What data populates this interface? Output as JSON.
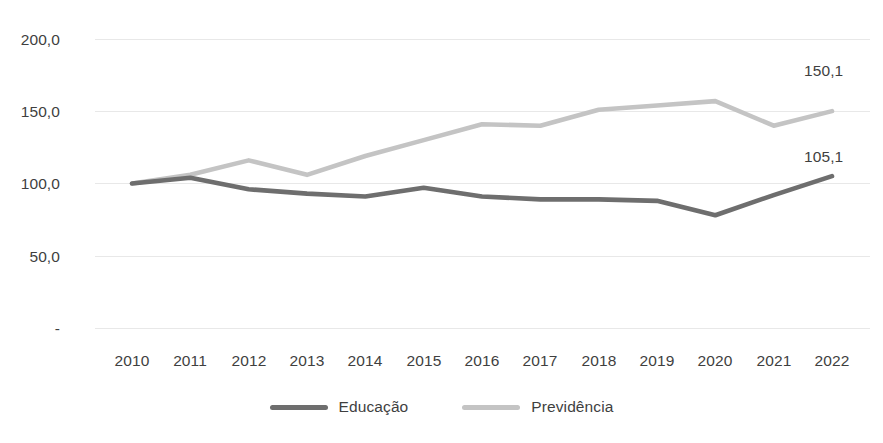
{
  "chart_data": {
    "type": "line",
    "title": "",
    "subtitle": "",
    "xlabel": "",
    "ylabel": "",
    "categories": [
      "2010",
      "2011",
      "2012",
      "2013",
      "2014",
      "2015",
      "2016",
      "2017",
      "2018",
      "2019",
      "2020",
      "2021",
      "2022"
    ],
    "ylim": [
      0,
      200
    ],
    "yticks": [
      0,
      50,
      100,
      150,
      200
    ],
    "ytick_labels": [
      "-",
      "50,0",
      "100,0",
      "150,0",
      "200,0"
    ],
    "grid": true,
    "legend_position": "bottom",
    "series": [
      {
        "name": "Educação",
        "color": "#6e6e6e",
        "values": [
          100.0,
          104.0,
          96.0,
          93.0,
          91.0,
          97.0,
          91.0,
          89.0,
          89.0,
          88.0,
          78.0,
          92.0,
          105.1
        ],
        "end_label": "105,1"
      },
      {
        "name": "Previdência",
        "color": "#c4c4c4",
        "values": [
          100.0,
          106.0,
          116.0,
          106.0,
          119.0,
          130.0,
          141.0,
          140.0,
          151.0,
          154.0,
          157.0,
          140.0,
          150.1
        ],
        "end_label": "150,1"
      }
    ],
    "annotations": [
      {
        "text": "150,1",
        "series": "Previdência",
        "category": "2022"
      },
      {
        "text": "105,1",
        "series": "Educação",
        "category": "2022"
      }
    ]
  },
  "legend": {
    "items": [
      {
        "label": "Educação",
        "color": "#6e6e6e"
      },
      {
        "label": "Previdência",
        "color": "#c4c4c4"
      }
    ]
  },
  "axis": {
    "y_labels": [
      "200,0",
      "150,0",
      "100,0",
      "50,0",
      "-"
    ],
    "x_labels": [
      "2010",
      "2011",
      "2012",
      "2013",
      "2014",
      "2015",
      "2016",
      "2017",
      "2018",
      "2019",
      "2020",
      "2021",
      "2022"
    ]
  },
  "colors": {
    "educacao": "#6e6e6e",
    "previdencia": "#c4c4c4",
    "grid": "#e8e8e8",
    "text": "#3f3f3f",
    "background": "#ffffff"
  }
}
